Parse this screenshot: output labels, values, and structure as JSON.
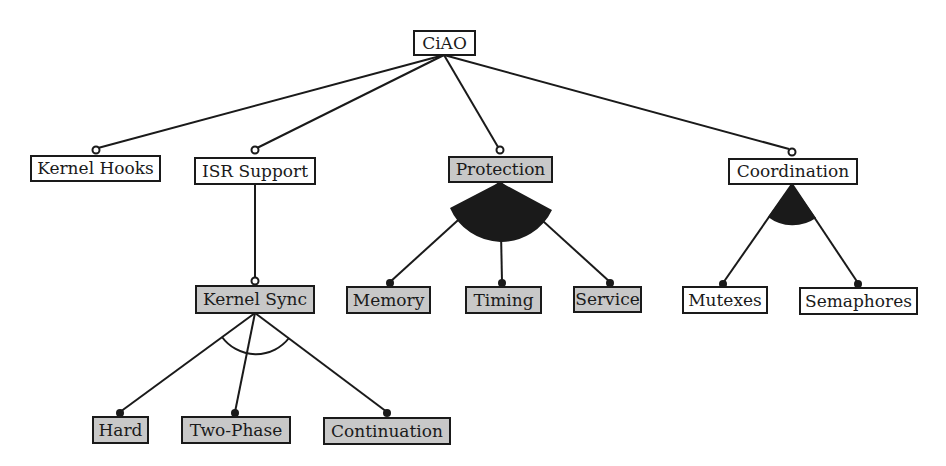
{
  "diagram": {
    "colors": {
      "line": "#1a1a1a",
      "selected_fill": "#c8c8c8",
      "unselected_fill": "#ffffff"
    },
    "nodes": {
      "ciao": {
        "label": "CiAO",
        "selected": false
      },
      "kernel_hooks": {
        "label": "Kernel Hooks",
        "selected": false,
        "relation": "optional"
      },
      "isr_support": {
        "label": "ISR Support",
        "selected": false,
        "relation": "optional"
      },
      "protection": {
        "label": "Protection",
        "selected": true,
        "relation": "optional"
      },
      "coordination": {
        "label": "Coordination",
        "selected": false,
        "relation": "optional"
      },
      "kernel_sync": {
        "label": "Kernel Sync",
        "selected": true,
        "relation": "optional"
      },
      "memory": {
        "label": "Memory",
        "selected": true,
        "relation": "mandatory"
      },
      "timing": {
        "label": "Timing",
        "selected": true,
        "relation": "mandatory"
      },
      "service": {
        "label": "Service",
        "selected": true,
        "relation": "mandatory"
      },
      "mutexes": {
        "label": "Mutexes",
        "selected": false,
        "relation": "mandatory"
      },
      "semaphores": {
        "label": "Semaphores",
        "selected": false,
        "relation": "mandatory"
      },
      "hard": {
        "label": "Hard",
        "selected": true,
        "relation": "mandatory"
      },
      "two_phase": {
        "label": "Two-Phase",
        "selected": true,
        "relation": "mandatory"
      },
      "continuation": {
        "label": "Continuation",
        "selected": true,
        "relation": "mandatory"
      }
    },
    "groups": [
      {
        "parent": "protection",
        "type": "or",
        "children": [
          "memory",
          "timing",
          "service"
        ]
      },
      {
        "parent": "coordination",
        "type": "or",
        "children": [
          "mutexes",
          "semaphores"
        ]
      },
      {
        "parent": "kernel_sync",
        "type": "alternative",
        "children": [
          "hard",
          "two_phase",
          "continuation"
        ]
      }
    ],
    "edges": [
      {
        "from": "ciao",
        "to": "kernel_hooks"
      },
      {
        "from": "ciao",
        "to": "isr_support"
      },
      {
        "from": "ciao",
        "to": "protection"
      },
      {
        "from": "ciao",
        "to": "coordination"
      },
      {
        "from": "isr_support",
        "to": "kernel_sync"
      }
    ]
  }
}
